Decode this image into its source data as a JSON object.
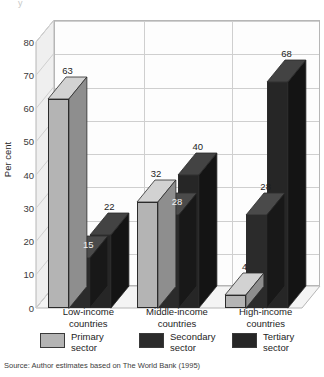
{
  "figure": {
    "top_crumb": "y",
    "source": "Source: Author estimates based on The World Bank (1995)"
  },
  "colors": {
    "primary": "#b4b4b4",
    "primary_top": "#d2d2d2",
    "primary_side": "#8e8e8e",
    "secondary": "#2b2b2b",
    "secondary_top": "#4a4a4a",
    "secondary_side": "#181818",
    "tertiary": "#262626",
    "tertiary_top": "#434343",
    "tertiary_side": "#141414",
    "wall": "#fdfdfd",
    "sidewall": "#efefef",
    "floor": "#f4f4f4",
    "grid": "#cfcfcf",
    "outline": "#b6b6b6"
  },
  "legend": {
    "items": [
      {
        "label": "Primary\nsector",
        "color_key": "primary"
      },
      {
        "label": "Secondary\nsector",
        "color_key": "secondary"
      },
      {
        "label": "Tertiary\nsector",
        "color_key": "tertiary"
      }
    ]
  },
  "chart_data": {
    "type": "bar",
    "title": "",
    "subtitle": "",
    "xlabel": "",
    "ylabel": "Per cent",
    "ylim": [
      0,
      80
    ],
    "yticks": [
      0,
      10,
      20,
      30,
      40,
      50,
      60,
      70,
      80
    ],
    "ytick_labels": [
      "0",
      "10",
      "20",
      "30",
      "40",
      "50",
      "60",
      "70",
      "80"
    ],
    "grid": true,
    "grid_axis": "y",
    "legend_position": "bottom",
    "three_d": true,
    "categories": [
      "Low-income\ncountries",
      "Middle-income\ncountries",
      "High-income\ncountries"
    ],
    "category_labels_flat": [
      "Low-income countries",
      "Middle-income countries",
      "High-income countries"
    ],
    "series": [
      {
        "name": "Primary sector",
        "values": [
          63,
          32,
          4
        ]
      },
      {
        "name": "Secondary sector",
        "values": [
          15,
          28,
          28
        ]
      },
      {
        "name": "Tertiary sector",
        "values": [
          22,
          40,
          68
        ]
      }
    ],
    "data_labels": [
      [
        "63",
        "15",
        "22"
      ],
      [
        "32",
        "28",
        "40"
      ],
      [
        "4",
        "28",
        "68"
      ]
    ],
    "units": "per cent"
  }
}
